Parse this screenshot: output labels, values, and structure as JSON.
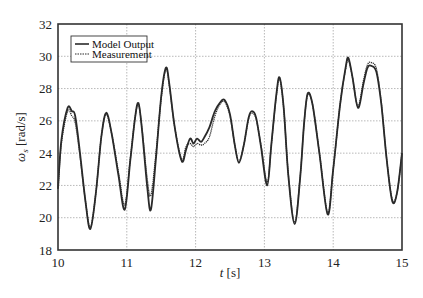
{
  "chart_data": {
    "type": "line",
    "title": "",
    "xlabel": "t [s]",
    "ylabel": "ω_s [rad/s]",
    "xlim": [
      10,
      15
    ],
    "ylim": [
      18,
      32
    ],
    "xticks": [
      10,
      11,
      12,
      13,
      14,
      15
    ],
    "yticks": [
      18,
      20,
      22,
      24,
      26,
      28,
      30,
      32
    ],
    "grid": true,
    "legend_position": "upper left",
    "series": [
      {
        "name": "Model Output",
        "style": "solid",
        "x": [
          10.0,
          10.05,
          10.14,
          10.2,
          10.25,
          10.32,
          10.4,
          10.47,
          10.55,
          10.63,
          10.7,
          10.78,
          10.88,
          10.97,
          11.05,
          11.12,
          11.17,
          11.22,
          11.3,
          11.35,
          11.42,
          11.5,
          11.57,
          11.62,
          11.7,
          11.8,
          11.86,
          11.92,
          11.97,
          12.02,
          12.08,
          12.13,
          12.2,
          12.28,
          12.35,
          12.42,
          12.5,
          12.57,
          12.63,
          12.7,
          12.77,
          12.82,
          12.88,
          12.95,
          13.04,
          13.1,
          13.17,
          13.22,
          13.28,
          13.35,
          13.44,
          13.52,
          13.58,
          13.63,
          13.7,
          13.8,
          13.92,
          14.0,
          14.1,
          14.18,
          14.22,
          14.28,
          14.36,
          14.44,
          14.5,
          14.56,
          14.63,
          14.7,
          14.78,
          14.86,
          14.93,
          15.0
        ],
        "y": [
          21.8,
          24.8,
          26.8,
          26.6,
          26.3,
          24.0,
          21.0,
          19.3,
          21.5,
          25.0,
          26.5,
          25.2,
          22.6,
          20.5,
          23.5,
          26.2,
          27.1,
          25.5,
          21.8,
          20.5,
          23.5,
          27.5,
          29.3,
          28.2,
          25.5,
          23.5,
          24.2,
          24.9,
          24.6,
          24.9,
          24.7,
          25.0,
          25.6,
          26.6,
          27.1,
          27.3,
          26.4,
          24.5,
          23.4,
          24.5,
          26.2,
          26.6,
          26.2,
          24.4,
          22.0,
          24.5,
          27.5,
          28.7,
          26.8,
          22.5,
          19.6,
          22.5,
          26.0,
          27.7,
          27.0,
          24.0,
          20.2,
          23.0,
          27.0,
          29.3,
          29.9,
          28.7,
          26.8,
          28.3,
          29.3,
          29.4,
          29.0,
          27.0,
          23.5,
          21.0,
          21.6,
          24.0
        ]
      },
      {
        "name": "Measurement",
        "style": "dotted",
        "x": [
          10.0,
          10.05,
          10.14,
          10.2,
          10.25,
          10.32,
          10.4,
          10.47,
          10.55,
          10.63,
          10.7,
          10.78,
          10.88,
          10.97,
          11.05,
          11.12,
          11.17,
          11.22,
          11.3,
          11.35,
          11.42,
          11.5,
          11.57,
          11.62,
          11.7,
          11.8,
          11.86,
          11.92,
          11.97,
          12.02,
          12.08,
          12.13,
          12.2,
          12.28,
          12.35,
          12.42,
          12.5,
          12.57,
          12.63,
          12.7,
          12.77,
          12.82,
          12.88,
          12.95,
          13.04,
          13.1,
          13.17,
          13.22,
          13.28,
          13.35,
          13.44,
          13.52,
          13.58,
          13.63,
          13.7,
          13.8,
          13.92,
          14.0,
          14.1,
          14.18,
          14.22,
          14.28,
          14.36,
          14.44,
          14.5,
          14.56,
          14.63,
          14.7,
          14.78,
          14.86,
          14.93,
          15.0
        ],
        "y": [
          21.8,
          24.6,
          26.6,
          26.3,
          25.9,
          23.8,
          21.0,
          19.4,
          21.5,
          25.0,
          26.4,
          25.2,
          22.8,
          20.8,
          23.6,
          26.2,
          27.0,
          25.6,
          22.3,
          21.4,
          23.8,
          27.4,
          29.2,
          28.1,
          25.5,
          23.6,
          24.4,
          24.6,
          24.4,
          24.6,
          24.5,
          24.6,
          25.0,
          26.3,
          27.0,
          27.2,
          26.3,
          24.5,
          23.5,
          24.5,
          26.1,
          26.5,
          26.1,
          24.5,
          22.2,
          24.5,
          27.4,
          28.6,
          26.8,
          22.6,
          19.7,
          22.6,
          26.0,
          27.6,
          27.0,
          24.0,
          20.3,
          23.0,
          27.0,
          29.2,
          29.8,
          28.7,
          26.9,
          28.5,
          29.5,
          29.6,
          29.2,
          27.1,
          23.5,
          21.1,
          21.6,
          24.0
        ]
      }
    ]
  },
  "axes": {
    "xlabel_italic": "t",
    "xlabel_unit": " [s]",
    "ylabel_symbol": "ω",
    "ylabel_sub": "s",
    "ylabel_unit": " [rad/s]"
  },
  "legend": {
    "items": [
      {
        "label": "Model Output",
        "style": "solid"
      },
      {
        "label": "Measurement",
        "style": "dotted"
      }
    ]
  },
  "colors": {
    "line": "#2a2a2a",
    "grid": "#9a9a9a",
    "frame": "#333333"
  }
}
